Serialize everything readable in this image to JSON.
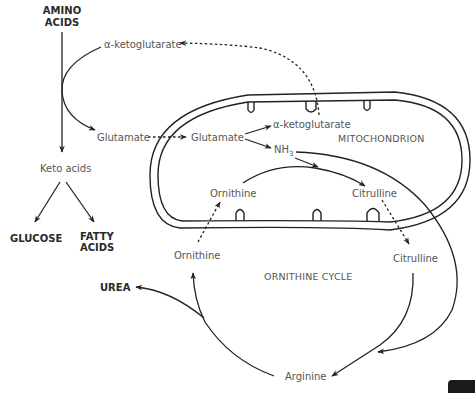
{
  "diagram": {
    "compartments": {
      "mitochondrion": "MITOCHONDRION",
      "cycle": "ORNITHINE CYCLE"
    },
    "inputs": {
      "amino_acids_line1": "AMINO",
      "amino_acids_line2": "ACIDS"
    },
    "outputs": {
      "glucose": "GLUCOSE",
      "fatty_acids_line1": "FATTY",
      "fatty_acids_line2": "ACIDS",
      "urea": "UREA"
    },
    "metabolites": {
      "akg_cytosol": "α-ketoglutarate",
      "glutamate_cytosol": "Glutamate",
      "glutamate_mito": "Glutamate",
      "akg_mito": "α-ketoglutarate",
      "nh3_base": "NH",
      "nh3_sub": "3",
      "keto_acids": "Keto acids",
      "ornithine_mito": "Ornithine",
      "citrulline_mito": "Citrulline",
      "ornithine_cytosol": "Ornithine",
      "citrulline_cytosol": "Citrulline",
      "arginine": "Arginine"
    },
    "colors": {
      "line": "#222222",
      "label": "#555555",
      "bold_label": "#2a2a2a"
    }
  }
}
